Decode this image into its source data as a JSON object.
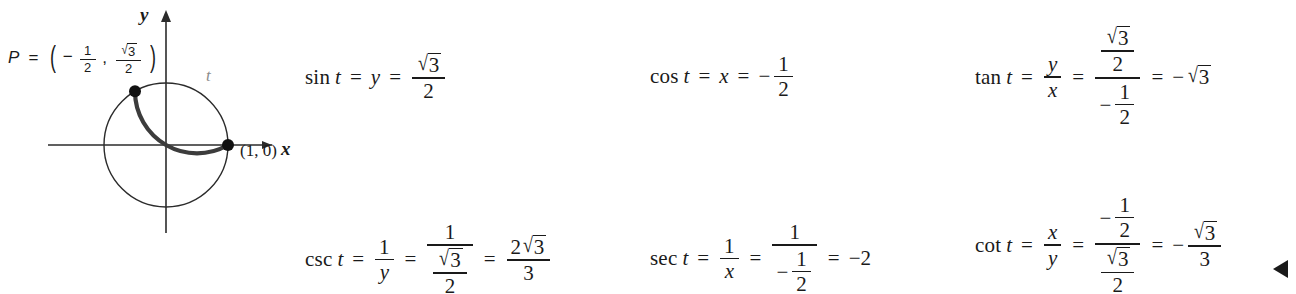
{
  "figure": {
    "point_label": {
      "name": "P",
      "equals": "=",
      "open_paren": "(",
      "close_paren": ")",
      "x_sign": "−",
      "x_num": "1",
      "x_den": "2",
      "comma": ",",
      "y_num_radical": "√",
      "y_num_radicand": "3",
      "y_den": "2"
    },
    "origin_point_label": "(1, 0)",
    "axis_label_x": "x",
    "axis_label_y": "y",
    "arc_label": "t",
    "arc_color": "#3c3c3c",
    "circle_color": "#2b2b2b",
    "axis_color": "#2b2b2b",
    "arc_start_deg": 0,
    "arc_end_deg": 120,
    "circle_center": [
      166,
      145
    ],
    "circle_radius": 62
  },
  "formulas": {
    "sin": {
      "func": "sin",
      "var_t": "t",
      "eq1": "=",
      "coord": "y",
      "eq2": "=",
      "radical": "√",
      "radicand": "3",
      "den": "2"
    },
    "cos": {
      "func": "cos",
      "var_t": "t",
      "eq1": "=",
      "coord": "x",
      "eq2": "=",
      "sign": "−",
      "num": "1",
      "den": "2"
    },
    "tan": {
      "func": "tan",
      "var_t": "t",
      "eq1": "=",
      "ratio_num": "y",
      "ratio_den": "x",
      "eq2": "=",
      "big_num_radical": "√",
      "big_num_radicand": "3",
      "big_num_den": "2",
      "big_den_sign": "−",
      "big_den_num": "1",
      "big_den_den": "2",
      "eq3": "=",
      "result_sign": "−",
      "result_radical": "√",
      "result_radicand": "3"
    },
    "csc": {
      "func": "csc",
      "var_t": "t",
      "eq1": "=",
      "ratio_num": "1",
      "ratio_den": "y",
      "eq2": "=",
      "big_num": "1",
      "big_den_radical": "√",
      "big_den_radicand": "3",
      "big_den_den": "2",
      "eq3": "=",
      "result_num_coeff": "2",
      "result_num_radical": "√",
      "result_num_radicand": "3",
      "result_den": "3"
    },
    "sec": {
      "func": "sec",
      "var_t": "t",
      "eq1": "=",
      "ratio_num": "1",
      "ratio_den": "x",
      "eq2": "=",
      "big_num": "1",
      "big_den_sign": "−",
      "big_den_num": "1",
      "big_den_den": "2",
      "eq3": "=",
      "result": "−2"
    },
    "cot": {
      "func": "cot",
      "var_t": "t",
      "eq1": "=",
      "ratio_num": "x",
      "ratio_den": "y",
      "eq2": "=",
      "big_num_sign": "−",
      "big_num_num": "1",
      "big_num_den": "2",
      "big_den_radical": "√",
      "big_den_radicand": "3",
      "big_den_den": "2",
      "eq3": "=",
      "result_sign": "−",
      "result_num_radical": "√",
      "result_num_radicand": "3",
      "result_den": "3"
    }
  }
}
